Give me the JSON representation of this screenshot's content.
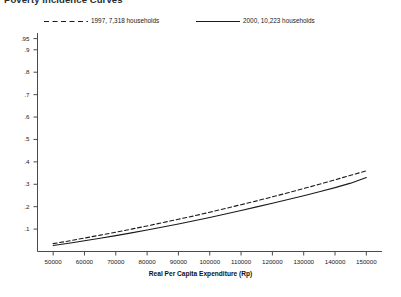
{
  "title": "Poverty Incidence Curves",
  "legend": {
    "position": "top",
    "entries": [
      {
        "label": "1997, 7,318 households",
        "style": "dashed",
        "color": "#1a1a1a"
      },
      {
        "label": "2000, 10,223 households",
        "style": "solid",
        "color": "#1a1a1a"
      }
    ]
  },
  "chart_data": {
    "type": "line",
    "title": "Poverty Incidence Curves",
    "xlabel": "Real Per Capita Expenditure (Rp)",
    "ylabel": "",
    "xlim": [
      45000,
      155000
    ],
    "ylim": [
      0,
      0.975
    ],
    "grid": false,
    "legend_position": "top",
    "x_ticks": [
      50000,
      60000,
      70000,
      80000,
      90000,
      100000,
      110000,
      120000,
      130000,
      140000,
      150000
    ],
    "x_tick_labels": [
      "50000",
      "60000",
      "70000",
      "80000",
      "90000",
      "100000",
      "110000",
      "120000",
      "130000",
      "140000",
      "150000"
    ],
    "y_ticks": [
      0.1,
      0.2,
      0.3,
      0.4,
      0.5,
      0.6,
      0.7,
      0.8,
      0.9,
      0.95
    ],
    "y_tick_labels": [
      ".1",
      ".2",
      ".3",
      ".4",
      ".5",
      ".6",
      ".7",
      ".8",
      ".9",
      ".95"
    ],
    "x": [
      50000,
      55000,
      60000,
      65000,
      70000,
      75000,
      80000,
      85000,
      90000,
      95000,
      100000,
      105000,
      110000,
      115000,
      120000,
      125000,
      130000,
      135000,
      140000,
      145000,
      150000
    ],
    "series": [
      {
        "name": "1997, 7,318 households",
        "style": "dashed",
        "color": "#1a1a1a",
        "values": [
          0.035,
          0.047,
          0.06,
          0.073,
          0.086,
          0.1,
          0.114,
          0.129,
          0.144,
          0.159,
          0.175,
          0.192,
          0.209,
          0.226,
          0.244,
          0.262,
          0.281,
          0.3,
          0.32,
          0.34,
          0.36
        ]
      },
      {
        "name": "2000, 10,223 households",
        "style": "solid",
        "color": "#1a1a1a",
        "values": [
          0.027,
          0.037,
          0.048,
          0.059,
          0.071,
          0.083,
          0.096,
          0.109,
          0.123,
          0.137,
          0.152,
          0.167,
          0.183,
          0.199,
          0.215,
          0.232,
          0.249,
          0.267,
          0.285,
          0.305,
          0.33
        ]
      }
    ]
  }
}
